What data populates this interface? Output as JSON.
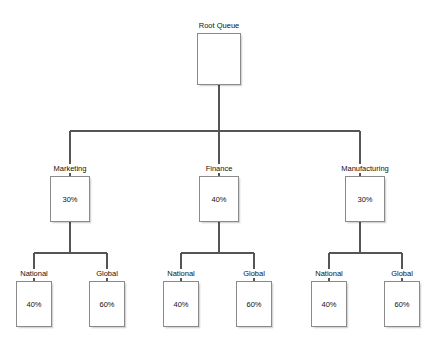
{
  "diagram": {
    "type": "tree",
    "title": "Root Queue",
    "style": {
      "background": "#ffffff",
      "box_fill": "#ffffff",
      "box_border": "#8a8a8a",
      "connector_color": "#555555",
      "text_color": "#111111"
    },
    "nodes": {
      "root": {
        "label": "Root Queue",
        "value": "",
        "x": 197,
        "y": 33,
        "w": 44,
        "h": 52
      },
      "level2": [
        {
          "label": "Marketing",
          "value": "30%",
          "x": 50,
          "y": 176,
          "w": 40,
          "h": 46
        },
        {
          "label": "Finance",
          "value": "40%",
          "x": 199,
          "y": 176,
          "w": 40,
          "h": 46
        },
        {
          "label": "Manufacturing",
          "value": "30%",
          "x": 345,
          "y": 176,
          "w": 40,
          "h": 46
        }
      ],
      "level3": [
        {
          "label": "National",
          "value": "40%",
          "x": 16,
          "y": 281,
          "w": 36,
          "h": 46
        },
        {
          "label": "Global",
          "value": "60%",
          "x": 89,
          "y": 281,
          "w": 36,
          "h": 46
        },
        {
          "label": "National",
          "value": "40%",
          "x": 163,
          "y": 281,
          "w": 36,
          "h": 46
        },
        {
          "label": "Global",
          "value": "60%",
          "x": 236,
          "y": 281,
          "w": 36,
          "h": 46
        },
        {
          "label": "National",
          "value": "40%",
          "x": 311,
          "y": 281,
          "w": 36,
          "h": 46
        },
        {
          "label": "Global",
          "value": "60%",
          "x": 384,
          "y": 281,
          "w": 36,
          "h": 46
        }
      ]
    }
  }
}
